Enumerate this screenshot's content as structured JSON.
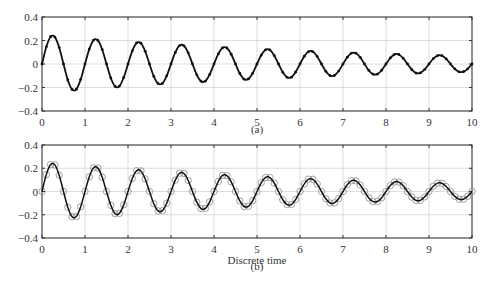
{
  "chart_data": [
    {
      "id": "a",
      "type": "line",
      "caption": "(a)",
      "xlabel": "",
      "ylabel": "",
      "xlim": [
        0,
        10
      ],
      "ylim": [
        -0.4,
        0.4
      ],
      "xticks": [
        0,
        1,
        2,
        3,
        4,
        5,
        6,
        7,
        8,
        9,
        10
      ],
      "yticks": [
        -0.4,
        -0.2,
        0,
        0.2,
        0.4
      ],
      "ytick_labels": [
        "−0.4",
        "−0.2",
        "0",
        "0.2",
        "0.4"
      ],
      "grid": true,
      "marker": "dot",
      "series": [
        {
          "name": "signal",
          "step": 0.1,
          "x_start": 0
        }
      ]
    },
    {
      "id": "b",
      "type": "line",
      "caption": "(b)",
      "xlabel": "Discrete time",
      "ylabel": "",
      "xlim": [
        0,
        10
      ],
      "ylim": [
        -0.4,
        0.4
      ],
      "xticks": [
        0,
        1,
        2,
        3,
        4,
        5,
        6,
        7,
        8,
        9,
        10
      ],
      "yticks": [
        -0.4,
        -0.2,
        0,
        0.2,
        0.4
      ],
      "ytick_labels": [
        "−0.4",
        "−0.2",
        "0",
        "0.2",
        "0.4"
      ],
      "grid": true,
      "marker": "open-circle",
      "series": [
        {
          "name": "signal",
          "step": 0.1,
          "x_start": 0
        }
      ]
    }
  ],
  "values": [
    0,
    0.145,
    0.232,
    0.229,
    0.14,
    0,
    -0.136,
    -0.217,
    -0.214,
    -0.131,
    0,
    0.127,
    0.204,
    0.201,
    0.123,
    0,
    -0.119,
    -0.191,
    -0.188,
    -0.115,
    0,
    0.112,
    0.179,
    0.177,
    0.108,
    0,
    -0.105,
    -0.167,
    -0.165,
    -0.101,
    0,
    0.098,
    0.157,
    0.155,
    0.095,
    0,
    -0.092,
    -0.147,
    -0.145,
    -0.089,
    0,
    0.086,
    0.138,
    0.136,
    0.083,
    0,
    -0.081,
    -0.129,
    -0.127,
    -0.078,
    0,
    0.076,
    0.121,
    0.12,
    0.073,
    0,
    -0.071,
    -0.113,
    -0.112,
    -0.068,
    0,
    0.066,
    0.106,
    0.105,
    0.064,
    0,
    -0.062,
    -0.099,
    -0.098,
    -0.06,
    0,
    0.058,
    0.093,
    0.092,
    0.056,
    0,
    -0.055,
    -0.087,
    -0.086,
    -0.053,
    0,
    0.051,
    0.082,
    0.081,
    0.049,
    0,
    -0.048,
    -0.077,
    -0.076,
    -0.046,
    0,
    0.045,
    0.072,
    0.071,
    0.043,
    0,
    -0.042,
    -0.067,
    -0.066,
    -0.041,
    0
  ],
  "colors": {
    "axis": "#333333",
    "grid": "#cfcfcf",
    "line": "#111111",
    "marker_b": "#8a8a8a"
  },
  "layout": {
    "panels": [
      {
        "left": 42,
        "right": 472,
        "top": 17,
        "bottom": 111,
        "caption_y": 133,
        "xtick_y": 126
      },
      {
        "left": 42,
        "right": 472,
        "top": 145,
        "bottom": 238,
        "caption_y": 270,
        "xtick_y": 253,
        "xlabel_y": 264
      }
    ]
  }
}
